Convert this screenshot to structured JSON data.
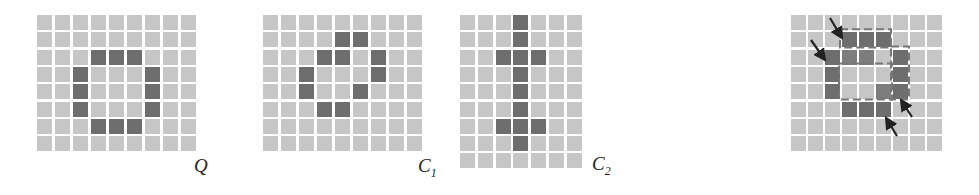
{
  "colors": {
    "light": "#c6c6c6",
    "dark": "#6e6e6e",
    "mid": "#7d7d7d",
    "arrow": "#222222"
  },
  "panels": [
    {
      "id": "Q",
      "label": "Q",
      "sub": "",
      "x": 37,
      "y": 15,
      "cols": 9,
      "rows": 8,
      "px": 18,
      "py": 17.3,
      "label_x": 194,
      "label_y": 155,
      "on": [
        [
          2,
          3
        ],
        [
          2,
          4
        ],
        [
          2,
          5
        ],
        [
          3,
          2
        ],
        [
          4,
          2
        ],
        [
          5,
          2
        ],
        [
          3,
          6
        ],
        [
          4,
          6
        ],
        [
          5,
          6
        ],
        [
          6,
          3
        ],
        [
          6,
          4
        ],
        [
          6,
          5
        ]
      ]
    },
    {
      "id": "C1",
      "label": "C",
      "sub": "1",
      "x": 263,
      "y": 15,
      "cols": 9,
      "rows": 8,
      "px": 18,
      "py": 17.3,
      "label_x": 418,
      "label_y": 155,
      "on": [
        [
          1,
          4
        ],
        [
          1,
          5
        ],
        [
          2,
          3
        ],
        [
          2,
          4
        ],
        [
          2,
          6
        ],
        [
          3,
          2
        ],
        [
          3,
          6
        ],
        [
          4,
          2
        ],
        [
          4,
          5
        ],
        [
          5,
          3
        ],
        [
          5,
          4
        ]
      ]
    },
    {
      "id": "C2",
      "label": "C",
      "sub": "2",
      "x": 460,
      "y": 15,
      "cols": 7,
      "rows": 9,
      "px": 17.8,
      "py": 17.3,
      "label_x": 592,
      "label_y": 153,
      "on": [
        [
          0,
          3
        ],
        [
          1,
          3
        ],
        [
          2,
          2
        ],
        [
          2,
          3
        ],
        [
          2,
          4
        ],
        [
          3,
          3
        ],
        [
          4,
          3
        ],
        [
          5,
          3
        ],
        [
          6,
          2
        ],
        [
          6,
          3
        ],
        [
          6,
          4
        ],
        [
          7,
          3
        ]
      ]
    }
  ],
  "overlay": {
    "x": 791,
    "y": 15,
    "cols": 9,
    "rows": 8,
    "px": 17,
    "py": 17.3,
    "on": [
      [
        1,
        3
      ],
      [
        1,
        4
      ],
      [
        1,
        5
      ],
      [
        2,
        2
      ],
      [
        3,
        2
      ],
      [
        4,
        2
      ],
      [
        2,
        6
      ],
      [
        3,
        6
      ],
      [
        4,
        6
      ],
      [
        5,
        3
      ],
      [
        5,
        4
      ],
      [
        5,
        5
      ]
    ],
    "mid": [
      [
        2,
        3
      ],
      [
        2,
        4
      ],
      [
        4,
        5
      ]
    ],
    "arrows": [
      {
        "x1": 830,
        "y1": 18,
        "x2": 842,
        "y2": 38
      },
      {
        "x1": 811,
        "y1": 40,
        "x2": 825,
        "y2": 60
      },
      {
        "x1": 912,
        "y1": 117,
        "x2": 901,
        "y2": 100
      },
      {
        "x1": 897,
        "y1": 136,
        "x2": 886,
        "y2": 118
      }
    ]
  }
}
